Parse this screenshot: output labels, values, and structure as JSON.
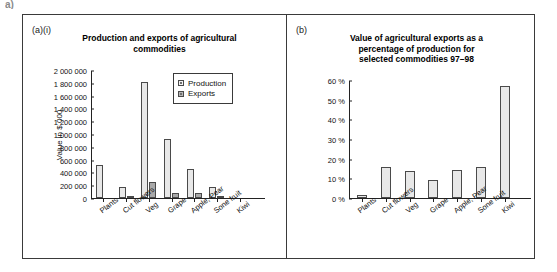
{
  "artifact": {
    "text": "a)"
  },
  "panels": {
    "left": {
      "tag": "(a)(i)",
      "title_lines": [
        "Production and exports of agricultural",
        "commodities"
      ],
      "y_axis_label": "Value in $ 000",
      "legend": [
        {
          "label": "Production",
          "swatch": "production"
        },
        {
          "label": "Exports",
          "swatch": "exports"
        }
      ]
    },
    "right": {
      "tag": "(b)",
      "title_lines": [
        "Value of agricultural exports as a",
        "percentage of production for",
        "selected commodities 97–98"
      ]
    }
  },
  "chart_data": [
    {
      "type": "bar",
      "panel": "(a)(i)",
      "title": "Production and exports of agricultural commodities",
      "xlabel": "",
      "ylabel": "Value in $ 000",
      "ylim": [
        0,
        2000000
      ],
      "grid": false,
      "legend_position": "top-right",
      "categories": [
        "Plants",
        "Cut flowers",
        "Veg",
        "Grape",
        "Apple, Pear",
        "Sone fruit",
        "Kiwi"
      ],
      "ytick_labels": [
        "0",
        "200 000",
        "400 000",
        "600 000",
        "800 000",
        "1 000 000",
        "1 200 000",
        "1 400 000",
        "1 600 000",
        "1 800 000",
        "2 000 000"
      ],
      "ytick_values": [
        0,
        200000,
        400000,
        600000,
        800000,
        1000000,
        1200000,
        1400000,
        1600000,
        1800000,
        2000000
      ],
      "series": [
        {
          "name": "Production",
          "values": [
            510000,
            165000,
            1815000,
            920000,
            455000,
            170000,
            0
          ]
        },
        {
          "name": "Exports",
          "values": [
            0,
            25000,
            255000,
            85000,
            75000,
            35000,
            0
          ]
        }
      ]
    },
    {
      "type": "bar",
      "panel": "(b)",
      "title": "Value of agricultural exports as a percentage of production for selected commodities 97–98",
      "xlabel": "",
      "ylabel": "",
      "ylim": [
        0,
        60
      ],
      "grid": false,
      "categories": [
        "Plants",
        "Cut flowers",
        "Veg",
        "Grape",
        "Apple, Pear",
        "Sone fruit",
        "Kiwi"
      ],
      "ytick_labels": [
        "0 %",
        "10 %",
        "20 %",
        "30 %",
        "40 %",
        "50 %",
        "60 %"
      ],
      "ytick_values": [
        0,
        10,
        20,
        30,
        40,
        50,
        60
      ],
      "series": [
        {
          "name": "Exports as % of production",
          "values": [
            1.5,
            16,
            13.5,
            9,
            14,
            16,
            57
          ]
        }
      ]
    }
  ],
  "colors": {
    "production_fill": "#e8e8e8",
    "exports_fill": "#a9a9a9",
    "bar_stroke": "#4a4a4a",
    "axis": "#222222",
    "panel_border": "#3a3a3a"
  }
}
